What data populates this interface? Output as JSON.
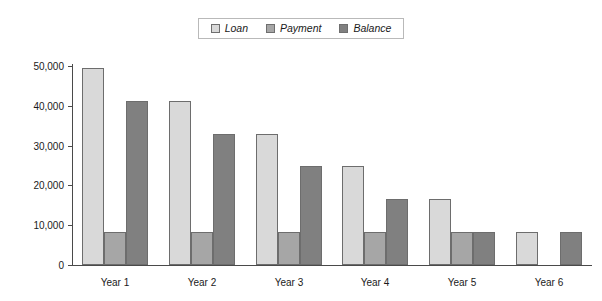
{
  "chart_data": {
    "type": "bar",
    "title": "",
    "subtitle": "",
    "xlabel": "",
    "ylabel": "",
    "categories": [
      "Year 1",
      "Year 2",
      "Year 3",
      "Year 4",
      "Year 5",
      "Year 6"
    ],
    "series": [
      {
        "name": "Loan",
        "color": "#d9d9d9",
        "values": [
          49500,
          41200,
          33000,
          24800,
          16500,
          8300
        ]
      },
      {
        "name": "Payment",
        "color": "#a6a6a6",
        "values": [
          8300,
          8300,
          8300,
          8300,
          8300,
          0
        ]
      },
      {
        "name": "Balance",
        "color": "#808080",
        "values": [
          41200,
          33000,
          24800,
          16500,
          8300,
          8300
        ]
      }
    ],
    "ylim": [
      0,
      50000
    ],
    "ytick_values": [
      0,
      10000,
      20000,
      30000,
      40000,
      50000
    ],
    "ytick_labels": [
      "0",
      "10,000",
      "20,000",
      "30,000",
      "40,000",
      "50,000"
    ],
    "grid": false,
    "legend_position": "top-center",
    "bar_outline_color": "#6d6d6d",
    "axis_color": "#4a4a4a"
  },
  "legend": {
    "entries": [
      {
        "label": "Loan"
      },
      {
        "label": "Payment"
      },
      {
        "label": "Balance"
      }
    ]
  }
}
